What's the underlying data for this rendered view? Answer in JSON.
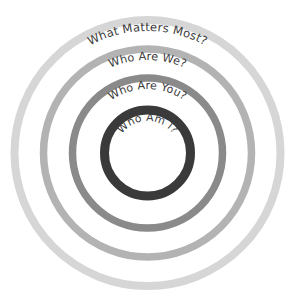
{
  "diagram": {
    "type": "concentric-rings",
    "background_color": "#ffffff",
    "text_color": "#3b3b3b",
    "center": {
      "x": 147.5,
      "y": 153
    },
    "rings": [
      {
        "id": "ring-outer",
        "label": "What Matters Most?",
        "level": 1,
        "radius": 133,
        "stroke_width": 8,
        "color": "#d6d6d6",
        "label_font_size": 11.6,
        "label_offset": 11
      },
      {
        "id": "ring-second",
        "label": "Who Are We?",
        "level": 2,
        "radius": 104,
        "stroke_width": 7.5,
        "color": "#b3b3b3",
        "label_font_size": 11.2,
        "label_offset": 11
      },
      {
        "id": "ring-third",
        "label": "Who Are You?",
        "level": 3,
        "radius": 75,
        "stroke_width": 7.5,
        "color": "#8a8a8a",
        "label_font_size": 11.0,
        "label_offset": 11
      },
      {
        "id": "ring-inner",
        "label": "Who Am I?",
        "level": 4,
        "radius": 43,
        "stroke_width": 9,
        "color": "#3a3a3a",
        "label_font_size": 10.8,
        "label_offset": 11
      }
    ]
  }
}
